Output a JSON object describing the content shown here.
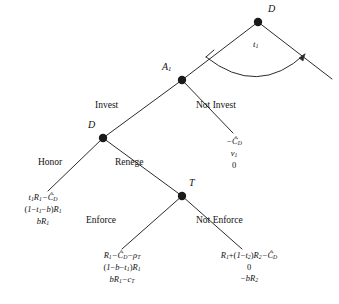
{
  "figure": {
    "type": "extensive-form-game-tree",
    "width": 339,
    "height": 304,
    "background": "#ffffff",
    "ink": "#111111"
  },
  "nodes": {
    "root": {
      "id": "root",
      "label": "D",
      "x": 258,
      "y": 22,
      "player": "D"
    },
    "a1": {
      "id": "a1",
      "label": "A",
      "sub": "1",
      "x": 182,
      "y": 80,
      "player": "A1"
    },
    "d2": {
      "id": "d2",
      "label": "D",
      "x": 103,
      "y": 138,
      "player": "D"
    },
    "t": {
      "id": "t",
      "label": "T",
      "x": 182,
      "y": 196,
      "player": "T"
    }
  },
  "arc": {
    "label": "t",
    "sub": "1",
    "has_arrowhead": true
  },
  "branches": {
    "invest": "Invest",
    "not_invest": "Not Invest",
    "honor": "Honor",
    "renege": "Renege",
    "enforce": "Enforce",
    "not_enforce": "Not Enforce"
  },
  "payoffs": {
    "not_invest": {
      "lines": [
        "−Ĉ_D",
        "v_1",
        "0"
      ],
      "rendered": [
        {
          "text": "−Ĉ",
          "sub": "D"
        },
        {
          "text": "v",
          "sub": "1"
        },
        {
          "text": "0",
          "sub": ""
        }
      ]
    },
    "honor": {
      "lines": [
        "t_1R_1−Ĉ_D",
        "(1−t_1−b)R_1",
        "bR_1"
      ]
    },
    "enforce": {
      "lines": [
        "R_1−Ĉ_D−ρ_T",
        "(1−b−t_1)R_1",
        "bR_1−c_T"
      ]
    },
    "not_enforce": {
      "lines": [
        "R_1+(1−t_2)R_2−Ĉ_D",
        "0",
        "−bR_2"
      ]
    }
  }
}
